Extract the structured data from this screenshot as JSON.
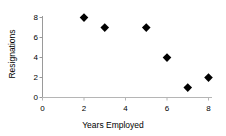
{
  "chart_data": {
    "type": "scatter",
    "title": "",
    "xlabel": "Years Employed",
    "ylabel": "Resignations",
    "x": [
      2,
      3,
      5,
      6,
      7,
      8
    ],
    "values": [
      8,
      7,
      7,
      4,
      1,
      2
    ],
    "points": [
      {
        "x": 2,
        "y": 8
      },
      {
        "x": 3,
        "y": 7
      },
      {
        "x": 5,
        "y": 7
      },
      {
        "x": 6,
        "y": 4
      },
      {
        "x": 7,
        "y": 1
      },
      {
        "x": 8,
        "y": 2
      }
    ],
    "xlim": [
      0,
      8.6
    ],
    "ylim": [
      0,
      8.8
    ],
    "xticks": [
      "0",
      "2",
      "4",
      "6",
      "8"
    ],
    "xtick_values": [
      0,
      2,
      4,
      6,
      8
    ],
    "yticks": [
      "0",
      "2",
      "4",
      "6",
      "8"
    ],
    "ytick_values": [
      0,
      2,
      4,
      6,
      8
    ],
    "grid": false,
    "legend": null,
    "marker": "diamond",
    "marker_color": "#000000",
    "axis_color": "#808080",
    "background": "#ffffff"
  }
}
